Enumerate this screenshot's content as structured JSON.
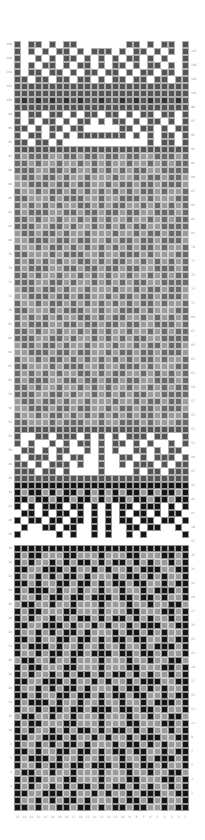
{
  "chart": {
    "title": "",
    "columns": 25,
    "rows": 110,
    "cell_px": 7,
    "colors": {
      "white": "#ffffff",
      "dark": "#555555",
      "mid": "#6a6a6a",
      "light": "#9a9a9a",
      "black": "#151515",
      "band_dark": "#333333"
    },
    "column_labels": [
      "25",
      "24",
      "23",
      "22",
      "21",
      "20",
      "19",
      "18",
      "17",
      "16",
      "15",
      "14",
      "13",
      "12",
      "11",
      "10",
      "9",
      "8",
      "7",
      "6",
      "5",
      "4",
      "3",
      "2",
      "1"
    ],
    "left_row_labels_desc": "even row numbers 108 down to 2",
    "right_row_labels_desc": "odd row numbers 107 down to 1",
    "bands": [
      {
        "name": "top-border",
        "rows_from_top": [
          0,
          9
        ],
        "bg": "white",
        "fg": "dark",
        "pattern": [
          "D.DD.D.DD.......DD.D.DD.D",
          "D.D.D.DD.D.DDD.D.DD.D.D.D",
          "D..D.D.DD.D.D.D.DD.D.D..D",
          "D.D.DD.D.DD.D.DD.D.DD.D.D",
          "D.DD.DD.D.DD.DD.D.DD.DD.D",
          "DD.DD.DD.DD.D.DD.DD.DD.DD",
          "DDDDDDDDDDDDDDDDDDDDDDDDD",
          "DDDDDDDDDDDDDDDDDDDDDDDDD",
          "DBDBDBDBDBDDBDDBDBDBDBDBD",
          "DDDDDDDDDDDDDDDDDDDDDDDDD"
        ]
      },
      {
        "name": "upper-border",
        "rows_from_top": [
          10,
          15
        ],
        "bg": "white",
        "fg": "dark",
        "pattern": [
          "D.DD.DD.D.DD.DD.D.DD.DD.D",
          "D.D.DD.D.DD.D.DD.D.DD.D.D",
          "DD.D.DD.DD.....DD.DD.D.DD",
          "D.DD.D.D.DDDDDDD.D.D.DD.D",
          "DD.DD.D............D.DD.D",
          "DDDDDDDDDDDDDDDDDDDDDDDDD"
        ]
      },
      {
        "name": "large-motif",
        "rows_from_top": [
          16,
          54
        ],
        "bg": "light",
        "fg": "mid",
        "pattern_repeat": [
          "M.MMM..MM.MM.MM.MM..MMM.M",
          "MM.M..M..M.M.M..M..M.M.MM",
          "MMM..MM.M..M.M.M.MM..MMMM",
          ".MM.MM.M..M...M..M.MM.MM.",
          "..MMM.MM.MM..M.MM.MM.MMM.",
          "M..M.MM.M.M.M.M.M.MM.M..M",
          "MM...M.MMM..M..MMM.M...MM",
          "M.M.M.M..MM.M.MM..M.M.M.M"
        ]
      },
      {
        "name": "middle-border",
        "rows_from_top": [
          55,
          62
        ],
        "bg": "white",
        "fg": "dark",
        "pattern": [
          "DDDDDDDDDDDDDDDDDDDDDDDDD",
          "D..DD.DDD.D.D.D.DDD.DD..D",
          "D.D..D.D.DD.D.DD.D.D..D.D",
          ".DD.D.DD..D.D.D..DD.D.DD.",
          "D.DDD.D.DD..D..DD.D.DDD.D",
          "DD.D.DDD.D..D..D.DDD.D.DD",
          "DDD.DD.D....D....D.DD.DDD",
          "DDDDDDDDDDDDDDDDDDDDDDDDD"
        ]
      },
      {
        "name": "dark-divider",
        "rows_from_top": [
          63,
          65
        ],
        "bg": "light",
        "fg": "black",
        "pattern": [
          "KKKKKKKKKKKKKKKKKKKKKKKKK",
          "K.KK.K.KK.K.K.K.KK.K.KK.K",
          "KK.KK.KK.KK.K.KK.KK.KK.KK"
        ]
      },
      {
        "name": "lower-border",
        "rows_from_top": [
          66,
          72
        ],
        "bg": "white",
        "fg": "black",
        "pattern": [
          "K.K.KKK.KK.K.K.KK.KKK.K.K",
          ".KK.K.KK.K.K.K.K.KK.K.KK.",
          "K.KK.KK.KK.K.K.KK.KK.KK.K",
          ".K..KK.KK..K.K..KK.KK..K.",
          "K.....K.K..K.K..K.K.....K",
          "...............  ........",
          "KKKKKKKKKKKKKKKKKKKKKKKKK"
        ]
      },
      {
        "name": "lower-motif",
        "rows_from_top": [
          73,
          109
        ],
        "bg": "light",
        "fg": "black",
        "pattern_repeat": [
          "K.KK...KK...K...KK...KK.K",
          "K.K..K.K.KK.K.KK.K.K..K.K",
          "KK..KKK.K..K.K..K.KKK..KK",
          "K..K.K.KK.K...K.KK.K.K..K",
          "KK.K..KK.KK.K.KK.KK..K.KK",
          "K.KKK.K..K..K..K..K.KKK.K",
          "K..K.KK.KK.KKK.KK.KK.K..K",
          ".KK..K..K...K...K..K..KK."
        ]
      }
    ]
  }
}
